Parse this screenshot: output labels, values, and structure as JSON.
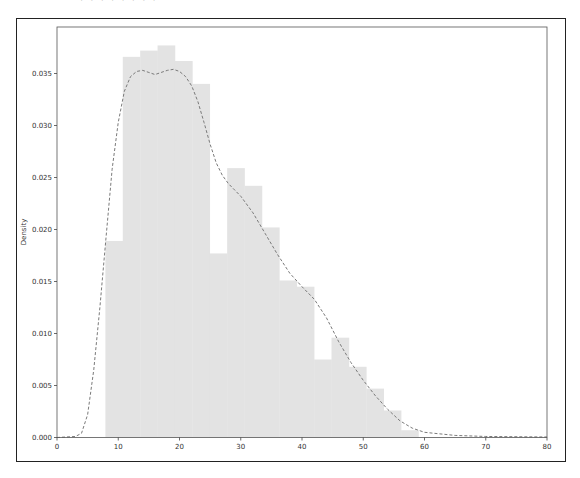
{
  "chart_data": {
    "type": "bar",
    "title": "",
    "xlabel": "",
    "ylabel": "Density",
    "xlim": [
      0,
      80
    ],
    "ylim": [
      0,
      0.0385
    ],
    "grid": false,
    "legend": null,
    "x_ticks": [
      "0",
      "10",
      "20",
      "30",
      "40",
      "50",
      "60",
      "70",
      "80"
    ],
    "y_ticks": [
      "0.000",
      "0.005",
      "0.010",
      "0.015",
      "0.020",
      "0.025",
      "0.030",
      "0.035"
    ],
    "histogram": {
      "bin_edges": [
        7.9,
        10.74,
        13.58,
        16.42,
        19.26,
        22.1,
        24.94,
        27.78,
        30.62,
        33.46,
        36.3,
        39.14,
        41.98,
        44.82,
        47.66,
        50.5,
        53.34,
        56.18,
        59.02
      ],
      "values": [
        0.0189,
        0.0366,
        0.0372,
        0.0377,
        0.0362,
        0.034,
        0.0177,
        0.0259,
        0.0242,
        0.0202,
        0.0151,
        0.0145,
        0.0075,
        0.0096,
        0.0068,
        0.0047,
        0.0026,
        0.0007
      ],
      "color": "#e3e3e3"
    },
    "kde": {
      "style": "dashed",
      "color": "#7a7a7a",
      "x": [
        0,
        3,
        4,
        5,
        6,
        7,
        8,
        9,
        10,
        11,
        12,
        13,
        14,
        15,
        16,
        17,
        18,
        19,
        20,
        21,
        22,
        23,
        24,
        25,
        26,
        27,
        28,
        29,
        30,
        32,
        34,
        36,
        38,
        40,
        42,
        44,
        46,
        48,
        50,
        52,
        54,
        56,
        58,
        60,
        65,
        70,
        80
      ],
      "y": [
        0,
        0.0001,
        0.0004,
        0.0022,
        0.0065,
        0.0125,
        0.0192,
        0.0258,
        0.0303,
        0.0333,
        0.0347,
        0.0352,
        0.0353,
        0.0351,
        0.0349,
        0.0351,
        0.0353,
        0.0354,
        0.0352,
        0.0347,
        0.0338,
        0.0323,
        0.0303,
        0.0282,
        0.0264,
        0.0252,
        0.0244,
        0.0238,
        0.0232,
        0.0216,
        0.0196,
        0.0176,
        0.0158,
        0.0145,
        0.0133,
        0.0115,
        0.0092,
        0.0072,
        0.0055,
        0.004,
        0.0027,
        0.0016,
        0.0009,
        0.0005,
        0.0002,
        0.0001,
        5e-05
      ]
    }
  },
  "page": {
    "top_clipped_text": "· · ·  · ·  · · ·"
  }
}
